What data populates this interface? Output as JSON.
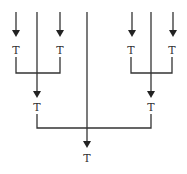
{
  "diagram": {
    "node_label": "T",
    "labels": {
      "left_top_1": "T",
      "left_top_2": "T",
      "right_top_1": "T",
      "right_top_2": "T",
      "left_mid": "T",
      "right_mid": "T",
      "bottom": "T"
    },
    "line_color": "#333333"
  }
}
